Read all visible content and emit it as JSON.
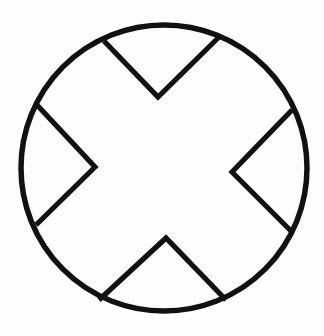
{
  "canvas": {
    "width": 324,
    "height": 336,
    "background_color": "#fdfdfd",
    "title": "Circle with inscribed X cross"
  },
  "style": {
    "stroke_color": "#111111",
    "fill_color": "none",
    "stroke_width": 5.5,
    "stroke_width_circle": 5.5,
    "stroke_width_cross": 5.2
  },
  "figure": {
    "type": "line-art-icon",
    "name": "circle-x-cross",
    "circle": {
      "center_x": 164,
      "center_y": 168,
      "radius": 143
    },
    "cross": {
      "notch_vertices": [
        {
          "name": "top-notch",
          "x": 158,
          "y": 97
        },
        {
          "name": "left-notch",
          "x": 95,
          "y": 167
        },
        {
          "name": "right-notch",
          "x": 232,
          "y": 172
        },
        {
          "name": "bottom-notch",
          "x": 166,
          "y": 238
        }
      ],
      "perimeter_junctions": [
        {
          "name": "top-left-upper",
          "x": 104,
          "y": 41
        },
        {
          "name": "top-right-upper",
          "x": 220,
          "y": 36
        },
        {
          "name": "left-upper",
          "x": 37,
          "y": 105
        },
        {
          "name": "right-upper",
          "x": 292,
          "y": 110
        },
        {
          "name": "left-lower",
          "x": 36,
          "y": 225
        },
        {
          "name": "right-lower",
          "x": 292,
          "y": 232
        },
        {
          "name": "bottom-left-lower",
          "x": 99,
          "y": 300
        },
        {
          "name": "bottom-right-lower",
          "x": 226,
          "y": 300
        }
      ],
      "outline_path": "M 104 41 L 158 97 L 220 36 M 292 110 L 232 172 L 292 232 M 226 300 L 166 238 L 99 300 M 36 225 L 95 167 L 37 105"
    }
  }
}
